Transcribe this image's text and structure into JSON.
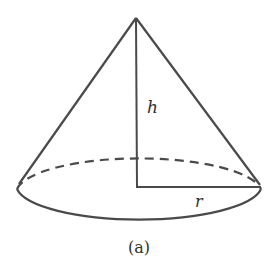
{
  "diagram": {
    "type": "cone",
    "labels": {
      "height": "h",
      "radius": "r",
      "caption": "(a)"
    },
    "colors": {
      "stroke": "#4a4a4a",
      "background": "#ffffff"
    }
  }
}
